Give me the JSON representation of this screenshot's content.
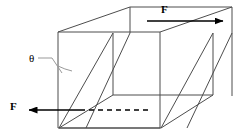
{
  "figure": {
    "background_color": "#ffffff",
    "line_color": "#4d4d4d",
    "arrow_color": "#000000",
    "text_color": "#000000",
    "width": 241,
    "height": 140
  },
  "labels": {
    "force_top": "F",
    "force_bottom": "F",
    "shear_angle": "θ"
  },
  "annotations": {
    "top_arrow": {
      "name": "force-arrow-top",
      "direction": "right",
      "from_x": 147,
      "from_y": 21,
      "to_x": 227,
      "to_y": 21
    },
    "bottom_arrow": {
      "name": "force-arrow-bottom",
      "direction": "left",
      "from_x": 78,
      "from_y": 110,
      "to_x": 25,
      "to_y": 110
    },
    "dashed_reference_line": {
      "name": "reference-dashed-line",
      "from_x": 78,
      "from_y": 110,
      "to_x": 148,
      "to_y": 110,
      "dash": "5 4"
    },
    "angle_arc": {
      "name": "shear-angle-arc",
      "center_x": 59,
      "center_y": 128,
      "radius": 72
    },
    "theta_leader": {
      "name": "theta-leader-line",
      "from_x": 38,
      "from_y": 58,
      "to_x": 57,
      "to_y": 66
    }
  },
  "geometry": {
    "front_face": {
      "name": "front-face",
      "points": "58,32 58,128 160,128 160,32"
    },
    "sheared_quads": [
      {
        "name": "left-shear-face",
        "points": "58,32 113,95 113,95 58,128"
      }
    ]
  }
}
